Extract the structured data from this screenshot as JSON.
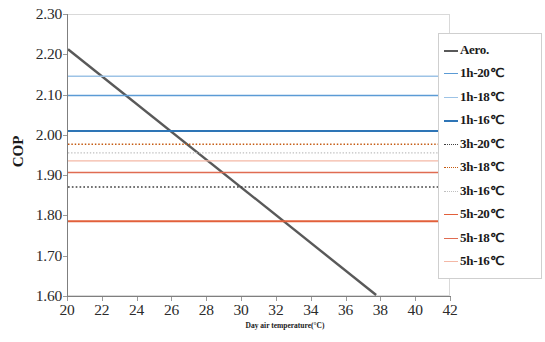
{
  "chart_data": {
    "type": "line",
    "title": "",
    "xlabel": "Day air temperature(°C)",
    "ylabel": "COP",
    "xlim": [
      20,
      42
    ],
    "ylim": [
      1.6,
      2.3
    ],
    "xticks": [
      20,
      22,
      24,
      26,
      28,
      30,
      32,
      34,
      36,
      38,
      40,
      42
    ],
    "yticks": [
      "1.60",
      "1.70",
      "1.80",
      "1.90",
      "2.00",
      "2.10",
      "2.20",
      "2.30"
    ],
    "grid": false,
    "legend_position": "right",
    "series": [
      {
        "name": "Aero.",
        "style": "solid",
        "color": "#595959",
        "width": 2.4,
        "kind": "sloped",
        "x": [
          20,
          37.7
        ],
        "y": [
          2.215,
          1.605
        ]
      },
      {
        "name": "1h-20℃",
        "style": "solid",
        "color": "#5b9bd5",
        "width": 1.6,
        "kind": "horizontal",
        "value": 2.1
      },
      {
        "name": "1h-18℃",
        "style": "solid",
        "color": "#9dc3e6",
        "width": 1.4,
        "kind": "horizontal",
        "value": 2.148
      },
      {
        "name": "1h-16℃",
        "style": "solid",
        "color": "#2e75b6",
        "width": 2.0,
        "kind": "horizontal",
        "value": 2.012
      },
      {
        "name": "3h-20℃",
        "style": "dotted",
        "color": "#404040",
        "width": 1.6,
        "kind": "horizontal",
        "value": 1.873
      },
      {
        "name": "3h-18℃",
        "style": "dotted",
        "color": "#c55a11",
        "width": 1.4,
        "kind": "horizontal",
        "value": 1.979
      },
      {
        "name": "3h-16℃",
        "style": "dotted",
        "color": "#bfbfbf",
        "width": 1.3,
        "kind": "horizontal",
        "value": 1.958
      },
      {
        "name": "5h-20℃",
        "style": "solid",
        "color": "#e2603b",
        "width": 1.9,
        "kind": "horizontal",
        "value": 1.788
      },
      {
        "name": "5h-18℃",
        "style": "solid",
        "color": "#e06c52",
        "width": 1.5,
        "kind": "horizontal",
        "value": 1.909
      },
      {
        "name": "5h-16℃",
        "style": "solid",
        "color": "#f4b8a6",
        "width": 1.3,
        "kind": "horizontal",
        "value": 1.938
      }
    ]
  },
  "legend": {
    "items": [
      {
        "label": "Aero."
      },
      {
        "label": "1h-20℃"
      },
      {
        "label": "1h-18℃"
      },
      {
        "label": "1h-16℃"
      },
      {
        "label": "3h-20℃"
      },
      {
        "label": "3h-18℃"
      },
      {
        "label": "3h-16℃"
      },
      {
        "label": "5h-20℃"
      },
      {
        "label": "5h-18℃"
      },
      {
        "label": "5h-16℃"
      }
    ]
  },
  "colors": {
    "axis": "#7f7f7f",
    "plot_border": "#d9d9d9",
    "text": "#1a1a1a",
    "background": "#ffffff"
  }
}
